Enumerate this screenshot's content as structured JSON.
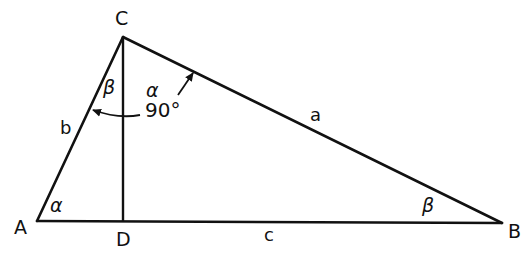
{
  "diagram": {
    "type": "right-triangle-with-altitude",
    "colors": {
      "stroke": "#111111",
      "background": "#ffffff"
    },
    "vertices": {
      "A": {
        "label": "A",
        "x": 37,
        "y": 221
      },
      "B": {
        "label": "B",
        "x": 502,
        "y": 223
      },
      "C": {
        "label": "C",
        "x": 123,
        "y": 37
      },
      "D": {
        "label": "D",
        "x": 123,
        "y": 221
      }
    },
    "sides": {
      "a": {
        "label": "a",
        "from": "C",
        "to": "B"
      },
      "b": {
        "label": "b",
        "from": "A",
        "to": "C"
      },
      "c": {
        "label": "c",
        "from": "A",
        "to": "B"
      }
    },
    "altitude": {
      "from": "C",
      "to": "D"
    },
    "angles": {
      "at_A": "α",
      "at_B": "β",
      "at_C_left": "β",
      "at_C_right": "α",
      "right_angle": "90°"
    }
  }
}
